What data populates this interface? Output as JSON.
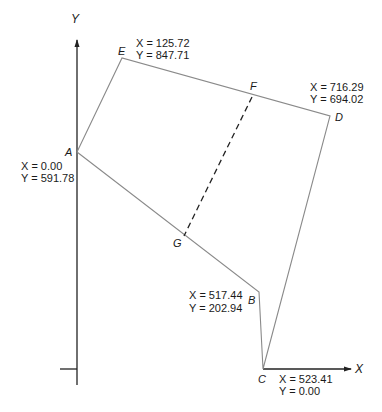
{
  "diagram": {
    "axes": {
      "x": {
        "label": "X"
      },
      "y": {
        "label": "Y"
      }
    },
    "points": {
      "A": {
        "label": "A",
        "x_text": "X = 0.00",
        "y_text": "Y = 591.78",
        "x": 0.0,
        "y": 591.78
      },
      "B": {
        "label": "B",
        "x_text": "X = 517.44",
        "y_text": "Y = 202.94",
        "x": 517.44,
        "y": 202.94
      },
      "C": {
        "label": "C",
        "x_text": "X = 523.41",
        "y_text": "Y = 0.00",
        "x": 523.41,
        "y": 0.0
      },
      "D": {
        "label": "D",
        "x_text": "X = 716.29",
        "y_text": "Y = 694.02",
        "x": 716.29,
        "y": 694.02
      },
      "E": {
        "label": "E",
        "x_text": "X = 125.72",
        "y_text": "Y = 847.71",
        "x": 125.72,
        "y": 847.71
      },
      "F": {
        "label": "F"
      },
      "G": {
        "label": "G"
      }
    },
    "polygon_order": [
      "A",
      "E",
      "F",
      "D",
      "C",
      "B",
      "G"
    ],
    "dividing_line": {
      "from": "F",
      "to": "G",
      "style": "dashed"
    },
    "colors": {
      "axis": "#222222",
      "boundary": "#8a8a8a",
      "dashed": "#222222",
      "text": "#1a1a1a"
    }
  }
}
